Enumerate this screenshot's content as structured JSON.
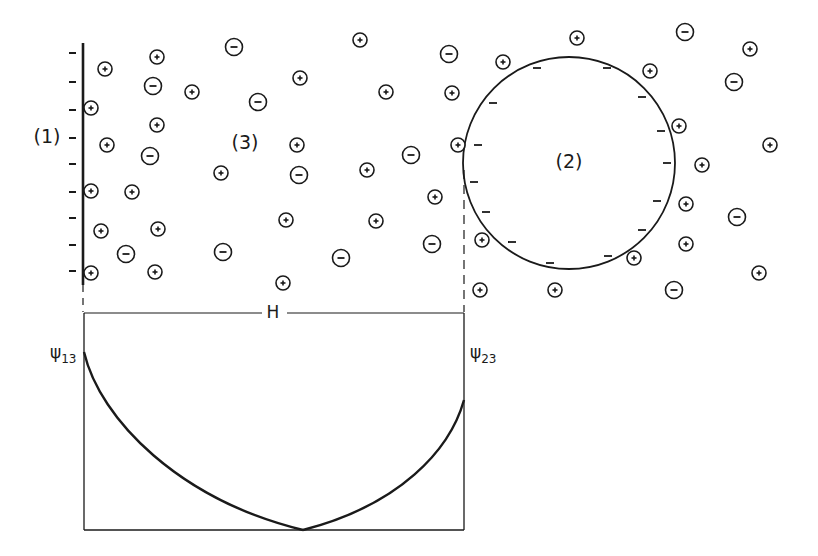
{
  "figure": {
    "width": 818,
    "height": 556,
    "ink_color": "#1a1a1a",
    "background": "#ffffff"
  },
  "labels": {
    "phase1": "(1)",
    "phase2": "(2)",
    "phase3": "(3)",
    "separation": "H",
    "psi13_main": "ψ",
    "psi13_sub": "13",
    "psi23_main": "ψ",
    "psi23_sub": "23"
  },
  "label_positions": {
    "phase1": [
      47,
      143
    ],
    "phase2": [
      569,
      168
    ],
    "phase3": [
      245,
      149
    ],
    "separation": [
      273,
      318
    ],
    "psi13": [
      50,
      358
    ],
    "psi23": [
      470,
      358
    ]
  },
  "plate": {
    "x": 83,
    "y_top": 43,
    "y_bottom": 285,
    "surface_charge": "negative",
    "minus_marks_y": [
      53,
      82,
      110,
      138,
      164,
      192,
      218,
      245,
      271
    ],
    "minus_mark_x": 73
  },
  "sphere": {
    "cx": 569,
    "cy": 163,
    "r": 106,
    "surface_charge": "negative",
    "inner_minus_marks": [
      [
        537,
        68
      ],
      [
        607,
        68
      ],
      [
        493,
        103
      ],
      [
        642,
        97
      ],
      [
        478,
        145
      ],
      [
        661,
        131
      ],
      [
        667,
        163
      ],
      [
        474,
        182
      ],
      [
        486,
        212
      ],
      [
        657,
        201
      ],
      [
        512,
        242
      ],
      [
        642,
        230
      ],
      [
        550,
        263
      ],
      [
        608,
        256
      ]
    ]
  },
  "ions": {
    "positive": [
      [
        105,
        69
      ],
      [
        157,
        57
      ],
      [
        192,
        92
      ],
      [
        91,
        108
      ],
      [
        157,
        125
      ],
      [
        107,
        145
      ],
      [
        91,
        191
      ],
      [
        132,
        192
      ],
      [
        101,
        231
      ],
      [
        158,
        229
      ],
      [
        91,
        273
      ],
      [
        155,
        272
      ],
      [
        221,
        173
      ],
      [
        286,
        220
      ],
      [
        283,
        283
      ],
      [
        300,
        78
      ],
      [
        297,
        145
      ],
      [
        360,
        40
      ],
      [
        386,
        92
      ],
      [
        452,
        93
      ],
      [
        458,
        145
      ],
      [
        367,
        170
      ],
      [
        435,
        197
      ],
      [
        376,
        221
      ],
      [
        482,
        240
      ],
      [
        480,
        290
      ],
      [
        555,
        290
      ],
      [
        503,
        62
      ],
      [
        577,
        38
      ],
      [
        650,
        71
      ],
      [
        679,
        126
      ],
      [
        702,
        165
      ],
      [
        686,
        204
      ],
      [
        686,
        244
      ],
      [
        634,
        258
      ],
      [
        750,
        49
      ],
      [
        770,
        145
      ],
      [
        759,
        273
      ]
    ],
    "negative": [
      [
        234,
        47
      ],
      [
        153,
        86
      ],
      [
        258,
        102
      ],
      [
        150,
        156
      ],
      [
        126,
        254
      ],
      [
        223,
        252
      ],
      [
        299,
        175
      ],
      [
        341,
        258
      ],
      [
        411,
        155
      ],
      [
        432,
        244
      ],
      [
        449,
        54
      ],
      [
        685,
        32
      ],
      [
        734,
        82
      ],
      [
        737,
        217
      ],
      [
        674,
        290
      ]
    ],
    "radius": 7
  },
  "dashed_guides": {
    "left": {
      "x": 83,
      "y1": 285,
      "y2": 312
    },
    "right": {
      "x": 464,
      "y1": 170,
      "y2": 312
    }
  },
  "dimension_line": {
    "y": 313,
    "x1": 84,
    "x2": 464,
    "gap": [
      262,
      287
    ]
  },
  "potential_plot": {
    "box": {
      "x1": 84,
      "x2": 464,
      "y_top": 313,
      "y_bottom": 530
    },
    "left_start": [
      84,
      352
    ],
    "minimum": [
      303,
      530
    ],
    "right_end": [
      464,
      400
    ],
    "curve_left_path": "M84,352 C100,420 180,500 303,530",
    "curve_right_path": "M303,530 C400,505 450,450 464,400"
  }
}
